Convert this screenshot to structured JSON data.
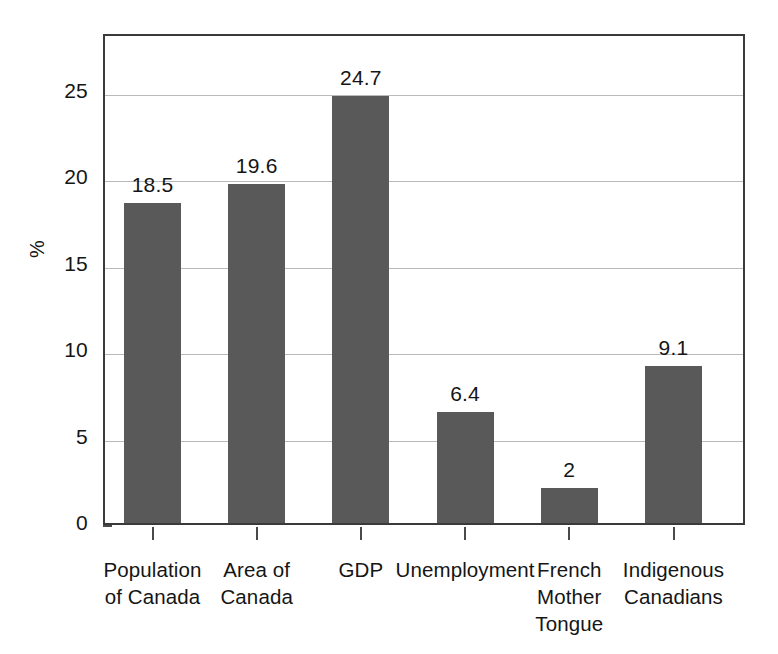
{
  "chart_data": {
    "type": "bar",
    "title": "",
    "subtitle": "",
    "xlabel": "",
    "ylabel": "%",
    "categories": [
      "Population\nof Canada",
      "Area of\nCanada",
      "GDP",
      "Unemployment",
      "French\nMother\nTongue",
      "Indigenous\nCanadians"
    ],
    "values": [
      18.5,
      19.6,
      24.7,
      6.4,
      2,
      9.1
    ],
    "data_labels": [
      "18.5",
      "19.6",
      "24.7",
      "6.4",
      "2",
      "9.1"
    ],
    "ylim": [
      0,
      28.4
    ],
    "yticks": [
      0,
      5,
      10,
      15,
      20,
      25
    ],
    "ytick_labels": [
      "0",
      "5",
      "10",
      "15",
      "20",
      "25"
    ],
    "grid": true,
    "grid_axis": "y",
    "legend": false,
    "legend_position": "none",
    "bar_color": "#595959",
    "grid_color": "#b9b9b9",
    "frame_color": "#3a3a3a",
    "background_color": "#ffffff",
    "text_color": "#151515"
  }
}
